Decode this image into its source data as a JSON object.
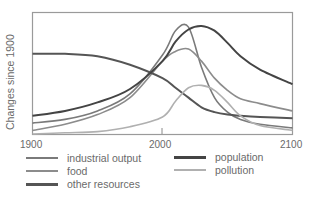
{
  "chart_data": {
    "type": "line",
    "title": "",
    "xlabel": "",
    "ylabel": "Changes since 1900",
    "x_ticks": [
      "1900",
      "2000",
      "2100"
    ],
    "xlim": [
      1900,
      2100
    ],
    "ylim": [
      0,
      100
    ],
    "grid": false,
    "legend_position": "bottom",
    "x": [
      1900,
      1925,
      1950,
      1975,
      2000,
      2010,
      2020,
      2030,
      2040,
      2050,
      2060,
      2075,
      2100
    ],
    "series": [
      {
        "name": "industrial output",
        "color": "#7a7a7a",
        "values": [
          9,
          12,
          19,
          33,
          65,
          85,
          88,
          55,
          30,
          18,
          12,
          8,
          5
        ]
      },
      {
        "name": "food",
        "color": "#8c8c8c",
        "values": [
          3,
          8,
          16,
          30,
          60,
          68,
          70,
          60,
          46,
          36,
          29,
          25,
          19
        ]
      },
      {
        "name": "other resources",
        "color": "#555555",
        "values": [
          66,
          66,
          64,
          57,
          46,
          38,
          30,
          22,
          18,
          16,
          15,
          14,
          13
        ]
      },
      {
        "name": "population",
        "color": "#444444",
        "values": [
          15,
          19,
          26,
          37,
          60,
          76,
          86,
          89,
          85,
          75,
          64,
          53,
          41
        ]
      },
      {
        "name": "pollution",
        "color": "#b0b0b0",
        "values": [
          0,
          1,
          2,
          6,
          14,
          27,
          38,
          40,
          36,
          26,
          15,
          7,
          3
        ]
      }
    ]
  },
  "labels": {
    "ylabel": "Changes since 1900",
    "x1900": "1900",
    "x2000": "2000",
    "x2100": "2100"
  },
  "legend": [
    {
      "label": "industrial output",
      "color": "#7a7a7a"
    },
    {
      "label": "food",
      "color": "#8c8c8c"
    },
    {
      "label": "other resources",
      "color": "#555555"
    },
    {
      "label": "population",
      "color": "#444444"
    },
    {
      "label": "pollution",
      "color": "#b0b0b0"
    }
  ]
}
